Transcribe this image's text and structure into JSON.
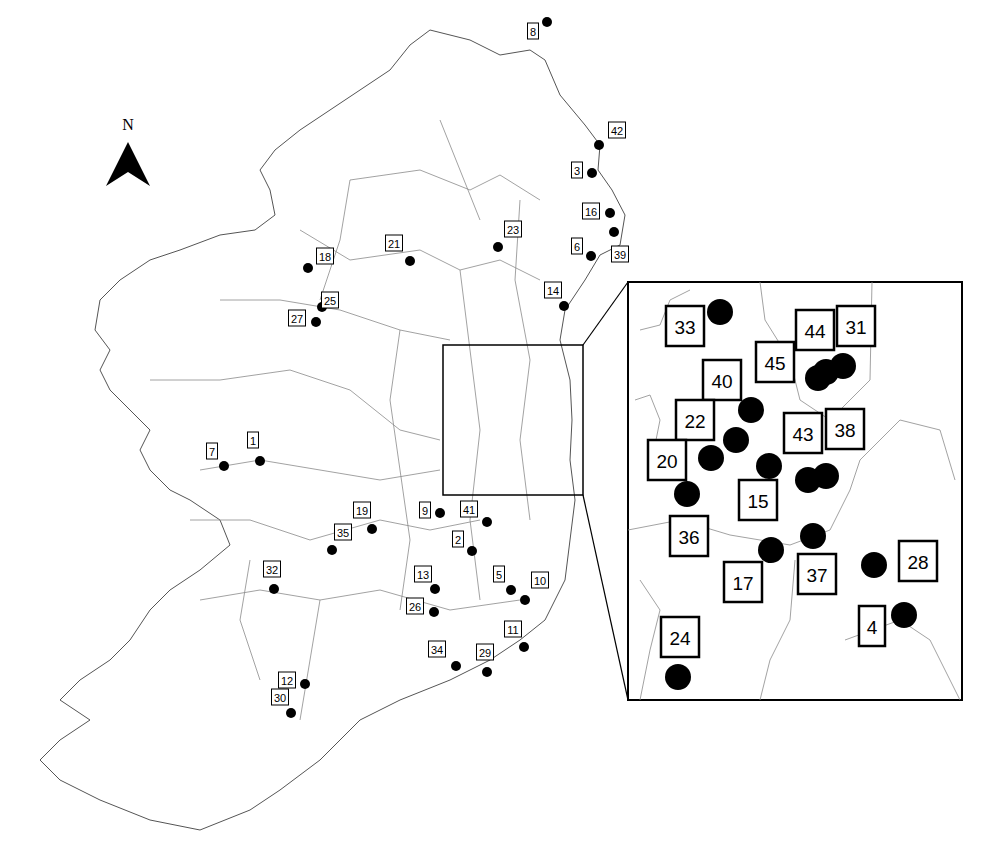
{
  "map": {
    "title": "",
    "north_label": "N",
    "colors": {
      "dot": "#000000",
      "outline": "#555555",
      "border": "#8a8a8a",
      "background": "#ffffff"
    },
    "main_sites": [
      {
        "id": "1"
      },
      {
        "id": "2"
      },
      {
        "id": "3"
      },
      {
        "id": "5"
      },
      {
        "id": "6"
      },
      {
        "id": "7"
      },
      {
        "id": "8"
      },
      {
        "id": "9"
      },
      {
        "id": "10"
      },
      {
        "id": "11"
      },
      {
        "id": "12"
      },
      {
        "id": "13"
      },
      {
        "id": "14"
      },
      {
        "id": "16"
      },
      {
        "id": "18"
      },
      {
        "id": "19"
      },
      {
        "id": "21"
      },
      {
        "id": "23"
      },
      {
        "id": "25"
      },
      {
        "id": "26"
      },
      {
        "id": "27"
      },
      {
        "id": "29"
      },
      {
        "id": "30"
      },
      {
        "id": "32"
      },
      {
        "id": "34"
      },
      {
        "id": "35"
      },
      {
        "id": "39"
      },
      {
        "id": "41"
      },
      {
        "id": "42"
      }
    ],
    "inset_sites": [
      {
        "id": "33"
      },
      {
        "id": "44"
      },
      {
        "id": "31"
      },
      {
        "id": "45"
      },
      {
        "id": "40"
      },
      {
        "id": "22"
      },
      {
        "id": "43"
      },
      {
        "id": "38"
      },
      {
        "id": "20"
      },
      {
        "id": "15"
      },
      {
        "id": "36"
      },
      {
        "id": "17"
      },
      {
        "id": "37"
      },
      {
        "id": "28"
      },
      {
        "id": "4"
      },
      {
        "id": "24"
      }
    ],
    "inset_caption": "Dublin region (enlarged)"
  }
}
